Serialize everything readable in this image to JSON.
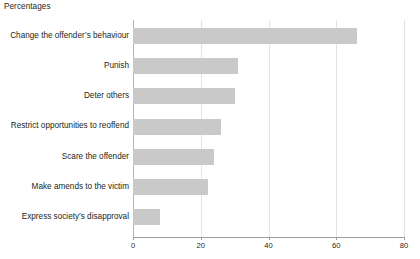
{
  "chart_data": {
    "type": "bar",
    "orientation": "horizontal",
    "title": "Percentages",
    "xlabel": "",
    "ylabel": "",
    "xlim": [
      0,
      80
    ],
    "xticks": [
      0,
      20,
      40,
      60,
      80
    ],
    "grid": true,
    "legend": false,
    "bar_color": "#c9c9c9",
    "categories": [
      "Change the offender’s behaviour",
      "Punish",
      "Deter others",
      "Restrict opportunities to reoffend",
      "Scare the offender",
      "Make amends to the victim",
      "Express society’s disapproval"
    ],
    "values": [
      66,
      31,
      30,
      26,
      24,
      22,
      8
    ]
  },
  "axis": {
    "tick_labels": [
      "0",
      "20",
      "40",
      "60",
      "80"
    ]
  }
}
